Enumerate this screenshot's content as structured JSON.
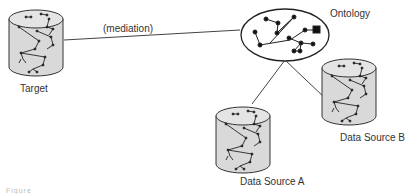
{
  "diagram": {
    "nodes": {
      "target": {
        "label": "Target",
        "shape": "cylinder"
      },
      "ontology": {
        "label": "Ontology",
        "shape": "ellipse-graph"
      },
      "source_a": {
        "label": "Data Source A",
        "shape": "cylinder"
      },
      "source_b": {
        "label": "Data Source B",
        "shape": "cylinder"
      }
    },
    "edges": [
      {
        "from": "target",
        "to": "ontology",
        "label": "(mediation)"
      },
      {
        "from": "ontology",
        "to": "source_a",
        "label": ""
      },
      {
        "from": "ontology",
        "to": "source_b",
        "label": ""
      }
    ],
    "caption": "Figure"
  },
  "colors": {
    "cylinder_fill": "#d9d9d9",
    "cylinder_top": "#e6e6e6",
    "stroke": "#333333",
    "background": "#ffffff"
  }
}
